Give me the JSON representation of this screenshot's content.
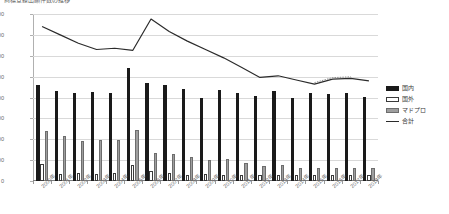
{
  "chart_title": "商標登録出願件数の推移",
  "legend": {
    "position": "right",
    "items": [
      {
        "label": "国内",
        "key": "domestic",
        "color": "#1a1a1a",
        "style": "bar"
      },
      {
        "label": "国外",
        "key": "overseas",
        "color": "#ffffff",
        "style": "bar"
      },
      {
        "label": "マドプロ",
        "key": "madpro",
        "color": "#9e9e9e",
        "style": "bar"
      },
      {
        "label": "合計",
        "key": "total",
        "color": "#2b2b2b",
        "style": "line"
      }
    ]
  },
  "chart_data": {
    "type": "bar",
    "title": "商標登録出願件数の推移",
    "xlabel": "",
    "ylabel": "",
    "ylim": [
      0,
      40000
    ],
    "ytick_step": 5000,
    "grid": true,
    "legend_position": "right",
    "categories": [
      "2000年",
      "2001年",
      "2002年",
      "2003年",
      "2004年",
      "2005年",
      "2006年",
      "2007年",
      "2008年",
      "2009年",
      "2010年",
      "2011年",
      "2012年",
      "2013年",
      "2014年",
      "2015年",
      "2016年",
      "2017年",
      "2018年"
    ],
    "ytick_labels": [
      "0",
      "5,000",
      "10,000",
      "15,000",
      "20,000",
      "25,000",
      "30,000",
      "35,000",
      "40,000"
    ],
    "series": [
      {
        "name": "国内",
        "type": "bar",
        "color": "#1a1a1a",
        "values": [
          23000,
          21500,
          21200,
          21300,
          21000,
          27000,
          23500,
          23000,
          22000,
          20000,
          21800,
          21000,
          20300,
          21500,
          19800,
          21000,
          20800,
          21200,
          20200
        ]
      },
      {
        "name": "国外",
        "type": "bar",
        "color": "#ffffff",
        "values": [
          4000,
          1600,
          2000,
          1700,
          2000,
          3800,
          2400,
          2000,
          1500,
          1600,
          1500,
          1500,
          1400,
          1500,
          1400,
          1500,
          1500,
          1500,
          1500
        ]
      },
      {
        "name": "マドプロ",
        "type": "bar",
        "color": "#9e9e9e",
        "values": [
          12000,
          10700,
          9700,
          9800,
          9800,
          12200,
          6700,
          6400,
          5700,
          5000,
          5300,
          4200,
          3700,
          3900,
          3200,
          3000,
          3100,
          3100,
          3000
        ]
      },
      {
        "name": "合計",
        "type": "line",
        "color": "#2b2b2b",
        "values": [
          37000,
          35000,
          33000,
          31500,
          31800,
          31300,
          38800,
          35800,
          33500,
          31500,
          29500,
          27200,
          24800,
          25200,
          24200,
          23200,
          24400,
          24600,
          24000
        ]
      }
    ]
  }
}
